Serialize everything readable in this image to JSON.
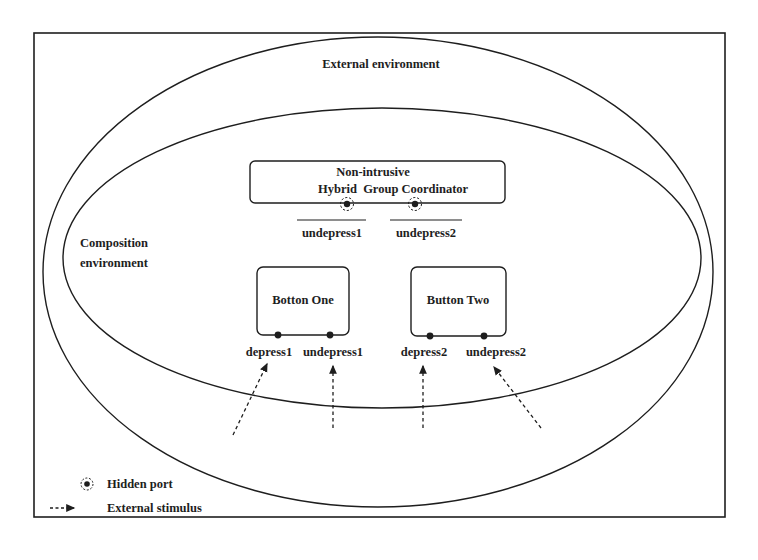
{
  "diagram": {
    "outer_environment": {
      "label": "External environment"
    },
    "composition_environment": {
      "label_line1": "Composition",
      "label_line2": "environment"
    },
    "coordinator": {
      "label_line1": "Non-intrusive",
      "label_line2": "Hybrid  Group Coordinator",
      "hidden_ports": [
        {
          "label": "undepress1"
        },
        {
          "label": "undepress2"
        }
      ]
    },
    "components": [
      {
        "label": "Botton One",
        "ports": [
          {
            "label": "depress1"
          },
          {
            "label": "undepress1"
          }
        ]
      },
      {
        "label": "Button Two",
        "ports": [
          {
            "label": "depress2"
          },
          {
            "label": "undepress2"
          }
        ]
      }
    ],
    "stimuli": [
      {
        "target": "depress1"
      },
      {
        "target": "undepress1"
      },
      {
        "target": "depress2"
      },
      {
        "target": "undepress2"
      }
    ],
    "legend": {
      "hidden_port": "Hidden port",
      "external_stimulus": "External stimulus"
    },
    "colors": {
      "stroke": "#1e1e1e",
      "background": "#ffffff"
    }
  }
}
